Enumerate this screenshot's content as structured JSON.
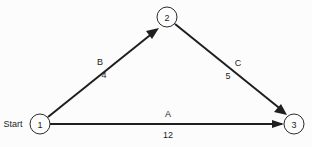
{
  "diagram": {
    "type": "activity-on-arrow-network",
    "background_color": "#fcfcfc",
    "line_color": "#1f1f1f",
    "terminal_labels": [
      {
        "id": "start",
        "text": "Start",
        "x": 13,
        "y": 124
      }
    ],
    "nodes": [
      {
        "id": "node-1",
        "label": "1",
        "x": 40,
        "y": 124,
        "r": 10
      },
      {
        "id": "node-2",
        "label": "2",
        "x": 167,
        "y": 17,
        "r": 10
      },
      {
        "id": "node-3",
        "label": "3",
        "x": 294,
        "y": 124,
        "r": 10
      }
    ],
    "edges": [
      {
        "id": "edge-b",
        "from": "1",
        "to": "2",
        "activity": "B",
        "duration": "4",
        "activity_label_x": 100,
        "activity_label_y": 62,
        "duration_label_x": 104,
        "duration_label_y": 75
      },
      {
        "id": "edge-c",
        "from": "2",
        "to": "3",
        "activity": "C",
        "duration": "5",
        "activity_label_x": 238,
        "activity_label_y": 63,
        "duration_label_x": 228,
        "duration_label_y": 76
      },
      {
        "id": "edge-a",
        "from": "1",
        "to": "3",
        "activity": "A",
        "duration": "12",
        "activity_label_x": 168,
        "activity_label_y": 114,
        "duration_label_x": 168,
        "duration_label_y": 135
      }
    ]
  }
}
